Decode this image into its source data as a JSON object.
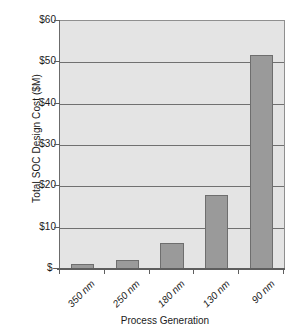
{
  "chart_data": {
    "type": "bar",
    "title": "",
    "categories": [
      "350 nm",
      "250 nm",
      "180 nm",
      "130 nm",
      "90 nm"
    ],
    "values": [
      1.2,
      2.2,
      6.3,
      17.9,
      51.7
    ],
    "xlabel": "Process Generation",
    "ylabel": "Total SOC Design Cost ($M)",
    "ylim": [
      0,
      60
    ],
    "ytick_values": [
      60,
      50,
      40,
      30,
      20,
      10,
      0
    ],
    "ytick_labels": [
      "$60",
      "$50",
      "$40",
      "$30",
      "$20",
      "$10",
      "$-"
    ],
    "grid": true,
    "legend": "none",
    "series": [
      {
        "name": "Total SOC Design Cost ($M)",
        "values": [
          1.2,
          2.2,
          6.3,
          17.9,
          51.7
        ]
      }
    ],
    "colors": {
      "bar_fill": "#9a9a9a",
      "bar_border": "#6e6e6e",
      "plot_background": "#e4e4e4",
      "gridline": "#707070",
      "axis": "#5e5e5e",
      "text": "#1a1a1a"
    }
  }
}
